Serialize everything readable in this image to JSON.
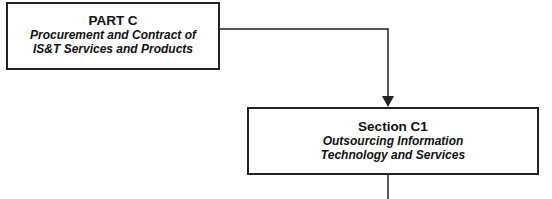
{
  "nodes": [
    {
      "id": "part-c",
      "title": "PART C",
      "subtitle_lines": [
        "Procurement and Contract of",
        "IS&T Services and Products"
      ]
    },
    {
      "id": "section-c1",
      "title": "Section C1",
      "subtitle_lines": [
        "Outsourcing Information",
        "Technology and Services"
      ]
    }
  ],
  "edges": [
    {
      "from": "part-c",
      "to": "section-c1",
      "arrow": true
    },
    {
      "from": "section-c1",
      "to": "continues-below",
      "arrow": false
    }
  ],
  "colors": {
    "line": "#222222",
    "background": "#ffffff"
  }
}
